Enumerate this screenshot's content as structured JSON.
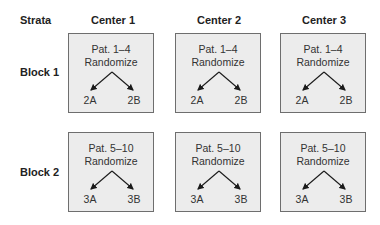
{
  "headers": {
    "strata": "Strata",
    "centers": [
      "Center 1",
      "Center 2",
      "Center 3"
    ]
  },
  "blocks": [
    {
      "label": "Block 1",
      "cells": [
        {
          "patients": "Pat. 1–4",
          "action": "Randomize",
          "arm_a": "2A",
          "arm_b": "2B"
        },
        {
          "patients": "Pat. 1–4",
          "action": "Randomize",
          "arm_a": "2A",
          "arm_b": "2B"
        },
        {
          "patients": "Pat. 1–4",
          "action": "Randomize",
          "arm_a": "2A",
          "arm_b": "2B"
        }
      ]
    },
    {
      "label": "Block 2",
      "cells": [
        {
          "patients": "Pat. 5–10",
          "action": "Randomize",
          "arm_a": "3A",
          "arm_b": "3B"
        },
        {
          "patients": "Pat. 5–10",
          "action": "Randomize",
          "arm_a": "3A",
          "arm_b": "3B"
        },
        {
          "patients": "Pat. 5–10",
          "action": "Randomize",
          "arm_a": "3A",
          "arm_b": "3B"
        }
      ]
    }
  ],
  "colors": {
    "box_fill": "#ececec",
    "box_border": "#6e6e6e",
    "arrow": "#1a1a1a"
  }
}
